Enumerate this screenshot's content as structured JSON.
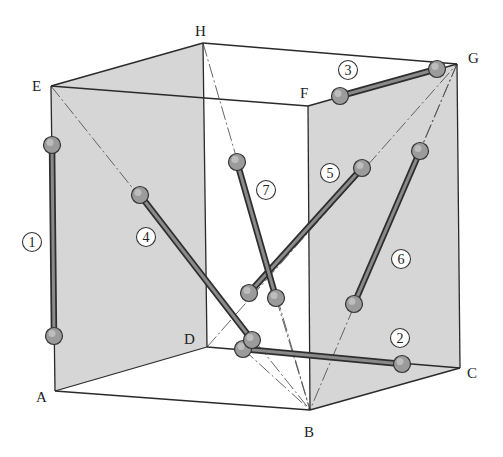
{
  "figure": {
    "colors": {
      "face_fill": "#d6d6d6",
      "edge": "#2a2a2a",
      "bar_dark": "#2e2e2e",
      "bar_light": "#8a8a8a",
      "ball": "#9b9b9b",
      "background": "#ffffff"
    },
    "vertices": [
      {
        "name": "A",
        "x": 55,
        "y": 391,
        "label_x": 36,
        "label_y": 402
      },
      {
        "name": "B",
        "x": 310,
        "y": 410,
        "label_x": 304,
        "label_y": 437
      },
      {
        "name": "C",
        "x": 460,
        "y": 368,
        "label_x": 467,
        "label_y": 378
      },
      {
        "name": "D",
        "x": 207,
        "y": 347,
        "label_x": 184,
        "label_y": 344
      },
      {
        "name": "E",
        "x": 51,
        "y": 86,
        "label_x": 32,
        "label_y": 91
      },
      {
        "name": "F",
        "x": 308,
        "y": 106,
        "label_x": 300,
        "label_y": 98
      },
      {
        "name": "G",
        "x": 457,
        "y": 64,
        "label_x": 468,
        "label_y": 63
      },
      {
        "name": "H",
        "x": 203,
        "y": 43,
        "label_x": 195,
        "label_y": 36
      }
    ],
    "shaded_faces": [
      "AEHD",
      "BCGF",
      "EFGH-left-part",
      "ABCD-partial"
    ],
    "diagonals": [
      {
        "from": "E",
        "to": "B"
      },
      {
        "from": "H",
        "to": "B"
      },
      {
        "from": "G",
        "to": "B"
      },
      {
        "from": "G",
        "to": "B-via-6"
      },
      {
        "from": "D",
        "to": "bar5-end"
      }
    ],
    "bars": [
      {
        "id": "1",
        "x1": 52,
        "y1": 145,
        "x2": 54,
        "y2": 336,
        "label_x": 32,
        "label_y": 242
      },
      {
        "id": "2",
        "x1": 243,
        "y1": 349,
        "x2": 402,
        "y2": 364,
        "label_x": 400,
        "label_y": 338
      },
      {
        "id": "3",
        "x1": 340,
        "y1": 96,
        "x2": 437,
        "y2": 69,
        "label_x": 348,
        "label_y": 70
      },
      {
        "id": "4",
        "x1": 140,
        "y1": 195,
        "x2": 252,
        "y2": 340,
        "label_x": 146,
        "label_y": 237
      },
      {
        "id": "5",
        "x1": 362,
        "y1": 168,
        "x2": 249,
        "y2": 293,
        "label_x": 330,
        "label_y": 173
      },
      {
        "id": "6",
        "x1": 420,
        "y1": 151,
        "x2": 354,
        "y2": 304,
        "label_x": 401,
        "label_y": 259
      },
      {
        "id": "7",
        "x1": 237,
        "y1": 162,
        "x2": 276,
        "y2": 298,
        "label_x": 266,
        "label_y": 190
      }
    ]
  }
}
